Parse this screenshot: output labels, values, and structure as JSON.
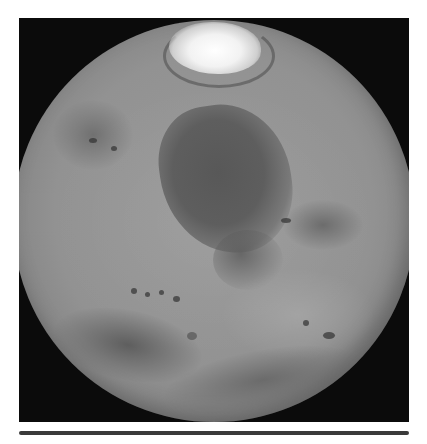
{
  "image": {
    "subject": "Mars globe",
    "style": "grayscale photograph",
    "background_color": "#0b0b0b",
    "page_color": "#ffffff",
    "features": [
      {
        "name": "north-polar-cap",
        "tone": "#f2f2f2"
      },
      {
        "name": "dark-plain-center",
        "tone": "#585858"
      },
      {
        "name": "dark-region-southwest",
        "tone": "#555555"
      },
      {
        "name": "dark-region-south",
        "tone": "#5f5f5f"
      },
      {
        "name": "highland-surface",
        "tone": "#929292"
      }
    ]
  },
  "rule": {
    "color": "#3a3a3a"
  }
}
